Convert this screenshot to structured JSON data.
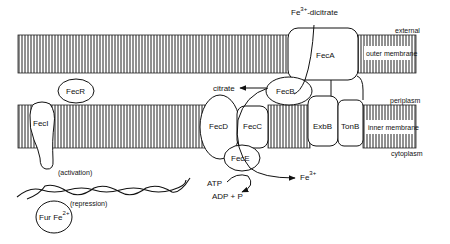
{
  "diagram": {
    "regions": {
      "external": "external",
      "outer_membrane": "outer membrane",
      "periplasm": "periplasm",
      "inner_membrane": "inner membrane",
      "cytoplasm": "cytoplasm"
    },
    "proteins": {
      "feca": "FecA",
      "fecb": "FecB",
      "fecc": "FecC",
      "fecd": "FecD",
      "fece": "FecE",
      "exbb": "ExbB",
      "tonb": "TonB",
      "fecr": "FecR",
      "feci": "FecI",
      "fur": "Fur Fe",
      "fur_sup": "2+"
    },
    "substrates": {
      "fe_dicitrate_base": "Fe",
      "fe_dicitrate_sup": "3+",
      "fe_dicitrate_suffix": "-dicitrate",
      "citrate": "citrate",
      "fe_out_base": "Fe",
      "fe_out_sup": "3+",
      "atp": "ATP",
      "adp_p": "ADP  +  P"
    },
    "annotations": {
      "activation": "(activation)",
      "repression": "(repression)"
    },
    "colors": {
      "line": "#111111",
      "background": "#ffffff"
    }
  }
}
